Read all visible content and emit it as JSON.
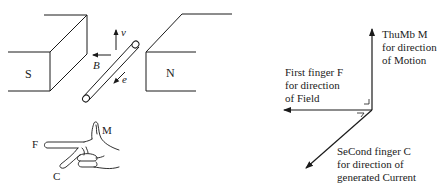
{
  "magnet": {
    "south_label": "S",
    "north_label": "N",
    "velocity_label": "v",
    "field_label": "B",
    "current_label": "e"
  },
  "hand": {
    "thumb_label": "M",
    "first_finger_label": "F",
    "second_finger_label": "C"
  },
  "axes": {
    "thumb": {
      "line1": "ThuMb M",
      "line2": "for direction",
      "line3": "of Motion"
    },
    "first_finger": {
      "line1": "First finger F",
      "line2": "for direction",
      "line3": "of Field"
    },
    "second_finger": {
      "line1": "SeCond finger C",
      "line2": "for direction of",
      "line3": "generated Current"
    }
  },
  "colors": {
    "ink": "#1a1a1a",
    "background": "#ffffff"
  }
}
